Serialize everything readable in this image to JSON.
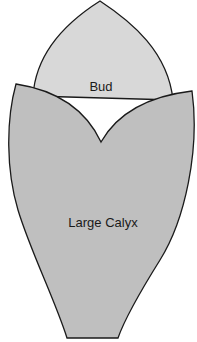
{
  "diagram": {
    "type": "botanical-illustration",
    "parts": [
      {
        "id": "bud",
        "label": "Bud",
        "fill": "#d8d8d8"
      },
      {
        "id": "calyx",
        "label": "Large Calyx",
        "fill": "#bfbfbf"
      }
    ],
    "outline_color": "#1a1a1a",
    "background": "#ffffff"
  }
}
